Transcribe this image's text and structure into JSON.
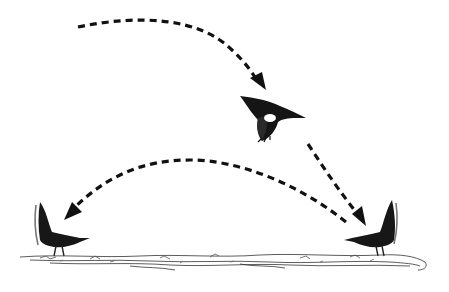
{
  "figure": {
    "colors": {
      "ink": "#111111",
      "background": "#ffffff",
      "wing_patch": "#ffffff"
    },
    "elements": [
      {
        "id": "arrow-top",
        "type": "dashed-arrow",
        "from": [
          78,
          27
        ],
        "to": [
          262,
          87
        ]
      },
      {
        "id": "bird-flying",
        "type": "bird",
        "pose": "flying",
        "center": [
          272,
          115
        ]
      },
      {
        "id": "arrow-right-down",
        "type": "dashed-arrow",
        "from": [
          308,
          145
        ],
        "to": [
          368,
          222
        ]
      },
      {
        "id": "arrow-arc-left",
        "type": "dashed-arrow",
        "from": [
          350,
          222
        ],
        "to": [
          65,
          218
        ]
      },
      {
        "id": "bird-left",
        "type": "bird",
        "pose": "perched-facing-right",
        "center": [
          58,
          235
        ]
      },
      {
        "id": "bird-right",
        "type": "bird",
        "pose": "perched-facing-left",
        "center": [
          375,
          235
        ]
      },
      {
        "id": "ground",
        "type": "ground-strip",
        "y": 262
      }
    ]
  }
}
